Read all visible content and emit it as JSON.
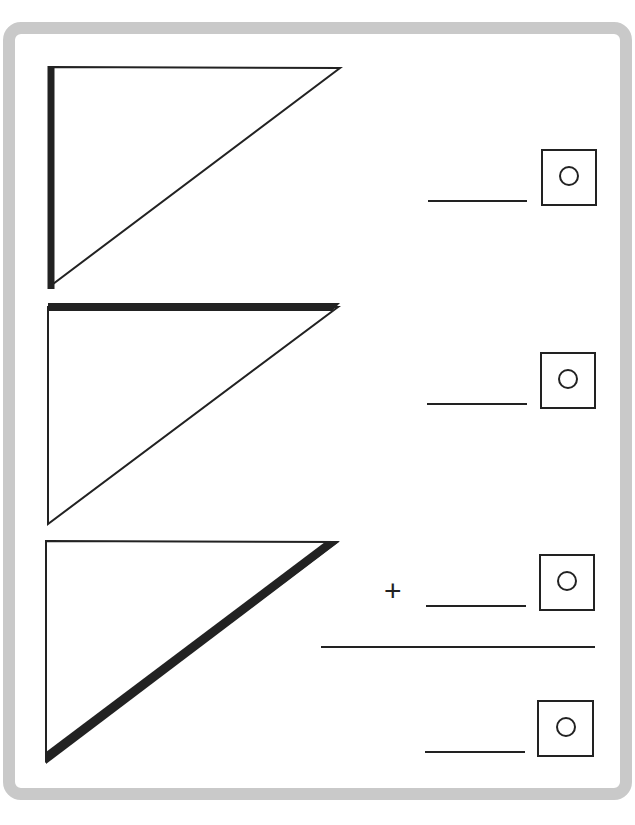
{
  "worksheet": {
    "frame_color": "#c9c9c9",
    "line_color": "#222222",
    "problems": [
      {
        "triangle": "right-triangle",
        "highlighted_side": "left-vertical-side",
        "answer": "",
        "unit_symbol": "degree-circle"
      },
      {
        "triangle": "right-triangle",
        "highlighted_side": "top-horizontal-side",
        "answer": "",
        "unit_symbol": "degree-circle"
      },
      {
        "triangle": "right-triangle",
        "highlighted_side": "hypotenuse",
        "answer": "",
        "unit_symbol": "degree-circle"
      }
    ],
    "sum": {
      "operator": "+",
      "result_answer": ""
    }
  }
}
